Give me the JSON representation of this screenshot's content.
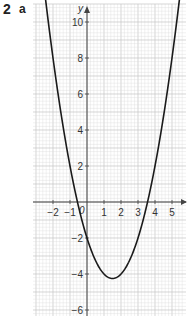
{
  "question": {
    "number": "2",
    "part": "a"
  },
  "chart_data": {
    "type": "line",
    "title": "",
    "xlabel": "",
    "ylabel": "y",
    "function": "y = x^2 - 3x - 2",
    "xlim": [
      -2.8,
      5.6
    ],
    "ylim": [
      -6.4,
      11.2
    ],
    "grid": true,
    "x_ticks": [
      -2,
      -1,
      1,
      2,
      3,
      4,
      5
    ],
    "y_ticks": [
      -6,
      -4,
      -2,
      2,
      4,
      6,
      8,
      10
    ],
    "x_tick_labels": [
      "−2",
      "−1",
      "1",
      "2",
      "3",
      "4",
      "5"
    ],
    "y_tick_labels": [
      "−6",
      "−4",
      "−2",
      "2",
      "4",
      "6",
      "8",
      "10"
    ],
    "origin_label": "0",
    "series": [
      {
        "name": "curve",
        "x": [
          -2.5,
          -2,
          -1.5,
          -1,
          -0.5,
          0,
          0.5,
          1,
          1.5,
          2,
          2.5,
          3,
          3.5,
          4,
          4.5,
          5,
          5.5
        ],
        "y": [
          11.75,
          8,
          4.75,
          2,
          -0.25,
          -2,
          -3.25,
          -4,
          -4.25,
          -4,
          -3.25,
          -2,
          -0.25,
          2,
          4.75,
          8,
          11.75
        ]
      }
    ],
    "features": {
      "vertex": [
        1.5,
        -4.25
      ],
      "roots": [
        -0.56,
        3.56
      ],
      "y_intercept": -2
    }
  },
  "colors": {
    "grid_minor": "#dcdcdc",
    "grid_major": "#c4c4c4",
    "axis": "#444444",
    "curve": "#1a1a1a"
  }
}
